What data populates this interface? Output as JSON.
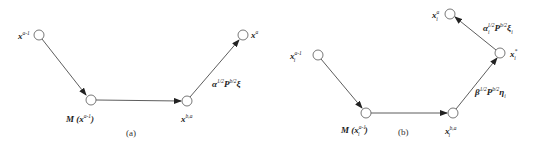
{
  "panels": [
    {
      "caption": "(a)",
      "nodes": [
        {
          "id": "x_prev",
          "label_base": "x",
          "label_sup": "a-1",
          "label_sub": "",
          "cx": 39,
          "cy": 35
        },
        {
          "id": "M",
          "label_base": "M (x",
          "label_sup": "a-1",
          "label_sub": "",
          "label_close": ")",
          "cx": 91,
          "cy": 100
        },
        {
          "id": "x_ba",
          "label_base": "x",
          "label_sup": "b,a",
          "label_sub": "",
          "cx": 187,
          "cy": 101
        },
        {
          "id": "x_a",
          "label_base": "x",
          "label_sup": "a",
          "label_sub": "",
          "cx": 243,
          "cy": 35
        }
      ],
      "edges": [
        {
          "from": "x_prev",
          "to": "M"
        },
        {
          "from": "M",
          "to": "x_ba"
        },
        {
          "from": "x_ba",
          "to": "x_a",
          "label": {
            "greek": "α",
            "exp": "1/2",
            "mat": "P",
            "mat_exp": "b/2",
            "vec": "ξ",
            "vec_sub": ""
          }
        }
      ]
    },
    {
      "caption": "(b)",
      "nodes": [
        {
          "id": "xi_prev",
          "label_base": "x",
          "label_sup": "a-1",
          "label_sub": "i",
          "cx": 318,
          "cy": 55
        },
        {
          "id": "Mi",
          "label_base": "M (x",
          "label_sup": "a-1",
          "label_sub": "i",
          "label_close": ")",
          "cx": 366,
          "cy": 113
        },
        {
          "id": "xi_ba",
          "label_base": "x",
          "label_sup": "b,a",
          "label_sub": "i",
          "cx": 453,
          "cy": 113
        },
        {
          "id": "xi_star",
          "label_base": "x",
          "label_sup": "*",
          "label_sub": "i",
          "cx": 500,
          "cy": 53
        },
        {
          "id": "xi_a",
          "label_base": "x",
          "label_sup": "a",
          "label_sub": "i",
          "cx": 450,
          "cy": 14
        }
      ],
      "edges": [
        {
          "from": "xi_prev",
          "to": "Mi"
        },
        {
          "from": "Mi",
          "to": "xi_ba"
        },
        {
          "from": "xi_ba",
          "to": "xi_star",
          "label": {
            "greek": "β",
            "exp": "1/2",
            "mat": "P",
            "mat_exp": "b/2",
            "vec": "η",
            "vec_sub": "i"
          }
        },
        {
          "from": "xi_star",
          "to": "xi_a",
          "label": {
            "greek": "α",
            "exp": "1/2",
            "mat": "P",
            "mat_exp": "b/2",
            "vec": "ξ",
            "vec_sub": "i",
            "greek_sub": "i"
          }
        }
      ]
    }
  ],
  "style": {
    "line_color": "#333333",
    "node_fill": "#ffffff",
    "node_stroke": "#555555",
    "node_radius": 5
  }
}
